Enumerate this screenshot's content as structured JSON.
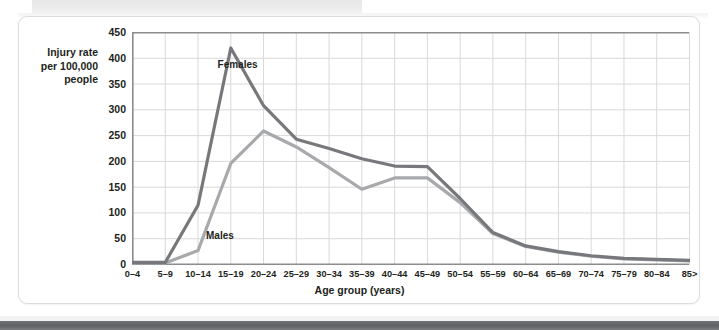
{
  "figure": {
    "y_axis_title_lines": [
      "Injury rate",
      "per 100,000",
      "people"
    ],
    "x_axis_title": "Age group (years)",
    "series_label_females": "Females",
    "series_label_males": "Males",
    "colors": {
      "females_line": "#77787b",
      "males_line": "#a7a9ac",
      "grid": "#d9d9d9",
      "axis": "#8c8c8c",
      "text": "#231f20",
      "card_border": "#dcdcdc",
      "bottom_bar": "#65676a"
    }
  },
  "chart_data": {
    "type": "line",
    "title": "",
    "xlabel": "Age group (years)",
    "ylabel": "Injury rate per 100,000 people",
    "ylim": [
      0,
      450
    ],
    "yticks": [
      0,
      50,
      100,
      150,
      200,
      250,
      300,
      350,
      400,
      450
    ],
    "grid": true,
    "legend": "inline-annotations",
    "categories": [
      "0–4",
      "5–9",
      "10–14",
      "15–19",
      "20–24",
      "25–29",
      "30–34",
      "35–39",
      "40–44",
      "45–49",
      "50–54",
      "55–59",
      "60–64",
      "65–69",
      "70–74",
      "75–79",
      "80–84",
      "85>"
    ],
    "series": [
      {
        "name": "Females",
        "color": "#77787b",
        "values": [
          4,
          4,
          115,
          420,
          308,
          243,
          225,
          205,
          191,
          190,
          128,
          62,
          36,
          25,
          17,
          12,
          10,
          8
        ]
      },
      {
        "name": "Males",
        "color": "#a7a9ac",
        "values": [
          3,
          3,
          27,
          196,
          259,
          228,
          188,
          146,
          168,
          168,
          120,
          60,
          35,
          24,
          16,
          11,
          9,
          7
        ]
      }
    ]
  }
}
